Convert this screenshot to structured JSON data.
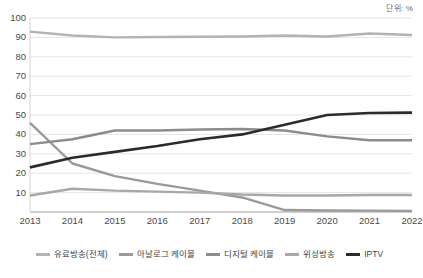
{
  "unit_note": "단위: %",
  "chart_data": {
    "type": "line",
    "title": "",
    "subtitle": "",
    "xlabel": "",
    "ylabel": "",
    "unit": "단위: %",
    "grid": true,
    "legend_position": "bottom",
    "ylim": [
      0,
      100
    ],
    "ytick_step": 10,
    "yticks": [
      "100",
      "90",
      "80",
      "70",
      "60",
      "50",
      "40",
      "30",
      "20",
      "10"
    ],
    "ytick_values": [
      100,
      90,
      80,
      70,
      60,
      50,
      40,
      30,
      20,
      10
    ],
    "categories": [
      "2013",
      "2014",
      "2015",
      "2016",
      "2017",
      "2018",
      "2019",
      "2020",
      "2021",
      "2022"
    ],
    "x": [
      2013,
      2014,
      2015,
      2016,
      2017,
      2018,
      2019,
      2020,
      2021,
      2022
    ],
    "series": [
      {
        "name": "유료방송(전체)",
        "color": "#b3b3b3",
        "width": 2.4,
        "values": [
          93.0,
          91.0,
          90.0,
          90.2,
          90.3,
          90.5,
          91.0,
          90.5,
          92.0,
          91.2
        ]
      },
      {
        "name": "아날로그 케이블",
        "color": "#9a9a9a",
        "width": 2.4,
        "values": [
          46.0,
          25.0,
          18.5,
          14.5,
          11.0,
          7.5,
          1.0,
          0.8,
          0.7,
          0.6
        ]
      },
      {
        "name": "디지털 케이블",
        "color": "#8c8c8c",
        "width": 2.4,
        "values": [
          35.0,
          37.5,
          42.0,
          42.0,
          42.5,
          42.8,
          42.0,
          39.0,
          37.0,
          37.0
        ]
      },
      {
        "name": "위성방송",
        "color": "#a8a8a8",
        "width": 2.4,
        "values": [
          8.5,
          12.0,
          11.0,
          10.5,
          10.0,
          9.0,
          8.5,
          8.5,
          8.8,
          8.8
        ]
      },
      {
        "name": "IPTV",
        "color": "#2b2b2b",
        "width": 2.6,
        "values": [
          23.0,
          28.0,
          31.0,
          34.0,
          37.5,
          40.0,
          45.0,
          50.0,
          51.0,
          51.2
        ]
      }
    ]
  }
}
